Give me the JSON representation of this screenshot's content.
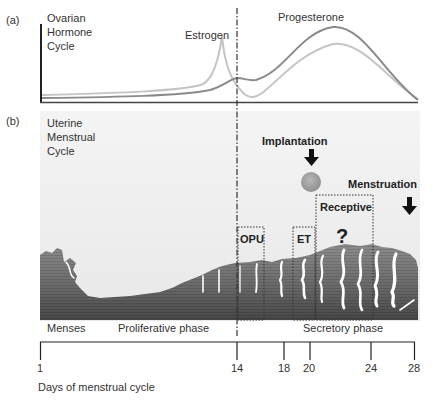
{
  "panel_a": {
    "label": "(a)",
    "title_lines": [
      "Ovarian",
      "Hormone",
      "Cycle"
    ],
    "estrogen_label": "Estrogen",
    "progesterone_label": "Progesterone",
    "colors": {
      "estrogen": "#c4c4c4",
      "progesterone": "#8a8a8a",
      "axis": "#222222"
    }
  },
  "panel_b": {
    "label": "(b)",
    "title_lines": [
      "Uterine",
      "Menstrual",
      "Cycle"
    ],
    "implantation_label": "Implantation",
    "menstruation_label": "Menstruation",
    "boxes": {
      "opu": "OPU",
      "et": "ET",
      "receptive": "Receptive"
    },
    "question_mark": "?",
    "colors": {
      "background": "#eeeeee",
      "lining_top": "#8c8c8c",
      "lining_bottom": "#474747",
      "embryo": "#a3a3a3"
    }
  },
  "phases": {
    "menses": "Menses",
    "proliferative": "Proliferative phase",
    "secretory": "Secretory phase"
  },
  "axis": {
    "ticks": [
      {
        "day": "1"
      },
      {
        "day": "14"
      },
      {
        "day": "18"
      },
      {
        "day": "20"
      },
      {
        "day": "24"
      },
      {
        "day": "28"
      }
    ],
    "label": "Days of menstrual cycle"
  }
}
